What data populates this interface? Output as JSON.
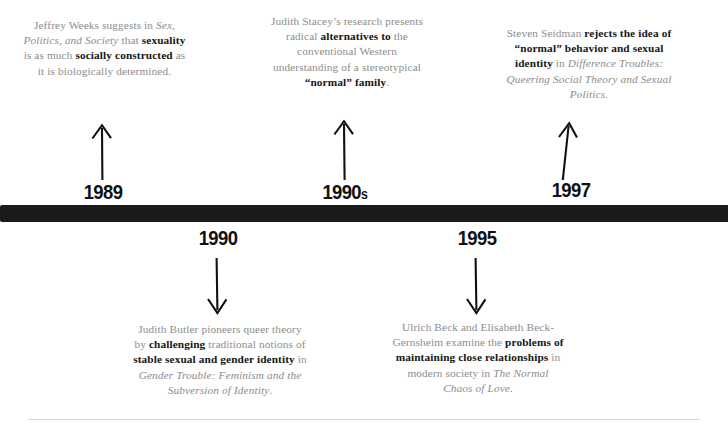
{
  "timeline": {
    "bar_color": "#1a1a1a",
    "rule_color": "#d8d8d8",
    "body_text_color": "#8d8d8d",
    "emphasis_text_color": "#161616",
    "events_above": [
      {
        "year": "1989",
        "year_suffix": "",
        "arrow": "arrow-up-icon",
        "text_runs": [
          {
            "text": "Jeffrey Weeks suggests in ",
            "style": "regular"
          },
          {
            "text": "Sex, Politics, and Society",
            "style": "italic"
          },
          {
            "text": " that ",
            "style": "regular"
          },
          {
            "text": "sexuality",
            "style": "bold"
          },
          {
            "text": " is as much ",
            "style": "regular"
          },
          {
            "text": "socially constructed",
            "style": "bold"
          },
          {
            "text": " as it is biologically determined.",
            "style": "regular"
          }
        ]
      },
      {
        "year": "1990",
        "year_suffix": "s",
        "arrow": "arrow-up-icon",
        "text_runs": [
          {
            "text": "Judith Stacey’s research presents radical ",
            "style": "regular"
          },
          {
            "text": "alternatives to",
            "style": "bold"
          },
          {
            "text": " the conventional Western understanding of a stereotypical ",
            "style": "regular"
          },
          {
            "text": "“normal” family",
            "style": "bold"
          },
          {
            "text": ".",
            "style": "regular"
          }
        ]
      },
      {
        "year": "1997",
        "year_suffix": "",
        "arrow": "arrow-up-icon",
        "text_runs": [
          {
            "text": "Steven Seidman ",
            "style": "regular"
          },
          {
            "text": "rejects the idea of “normal” behavior and sexual identity",
            "style": "bold"
          },
          {
            "text": " in ",
            "style": "regular"
          },
          {
            "text": "Difference Troubles: Queering Social Theory and Sexual Politics",
            "style": "italic"
          },
          {
            "text": ".",
            "style": "regular"
          }
        ]
      }
    ],
    "events_below": [
      {
        "year": "1990",
        "year_suffix": "",
        "arrow": "arrow-down-icon",
        "text_runs": [
          {
            "text": "Judith Butler pioneers queer theory by ",
            "style": "regular"
          },
          {
            "text": "challenging",
            "style": "bold"
          },
          {
            "text": " traditional notions of ",
            "style": "regular"
          },
          {
            "text": "stable sexual and gender identity",
            "style": "bold"
          },
          {
            "text": " in ",
            "style": "regular"
          },
          {
            "text": "Gender Trouble: Feminism and the Subversion of Identity",
            "style": "italic"
          },
          {
            "text": ".",
            "style": "regular"
          }
        ]
      },
      {
        "year": "1995",
        "year_suffix": "",
        "arrow": "arrow-down-icon",
        "text_runs": [
          {
            "text": "Ulrich Beck and Elisabeth Beck-Gernsheim examine the ",
            "style": "regular"
          },
          {
            "text": "problems of maintaining close relationships",
            "style": "bold"
          },
          {
            "text": " in modern society in ",
            "style": "regular"
          },
          {
            "text": "The Normal Chaos of Love",
            "style": "italic"
          },
          {
            "text": ".",
            "style": "regular"
          }
        ]
      }
    ]
  }
}
